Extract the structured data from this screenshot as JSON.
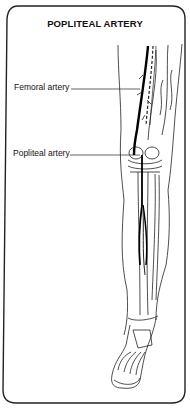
{
  "figure": {
    "title": "POPLITEAL ARTERY",
    "labels": [
      {
        "id": "femoral",
        "text": "Femoral artery"
      },
      {
        "id": "popliteal",
        "text": "Popliteal artery"
      }
    ],
    "colors": {
      "line": "#111111",
      "background": "#ffffff"
    }
  }
}
